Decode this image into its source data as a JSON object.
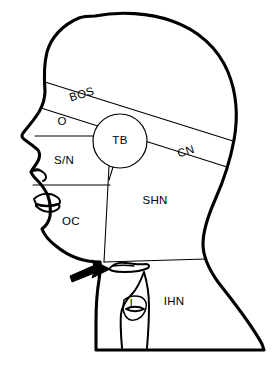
{
  "figure": {
    "view": "lateral profile, facing left",
    "background_color": "#ffffff",
    "line_color": "#000000"
  },
  "regions": [
    {
      "id": "bos",
      "abbr": "BOS",
      "name": "base-of-skull",
      "label_x": 82,
      "label_y": 95,
      "rotation": -17
    },
    {
      "id": "o",
      "abbr": "O",
      "name": "orbit",
      "label_x": 62,
      "label_y": 122,
      "rotation": 0
    },
    {
      "id": "tb",
      "abbr": "TB",
      "name": "temporal-bone",
      "label_x": 120,
      "label_y": 141,
      "rotation": 0
    },
    {
      "id": "cn",
      "abbr": "CN",
      "name": "cranial-nerves",
      "label_x": 186,
      "label_y": 152,
      "rotation": -17
    },
    {
      "id": "sn",
      "abbr": "S/N",
      "name": "sinus-nasal",
      "label_x": 64,
      "label_y": 161,
      "rotation": 0
    },
    {
      "id": "oc",
      "abbr": "OC",
      "name": "oral-cavity",
      "label_x": 71,
      "label_y": 222,
      "rotation": 0
    },
    {
      "id": "shn",
      "abbr": "SHN",
      "name": "suprahyoid-neck",
      "label_x": 155,
      "label_y": 201,
      "rotation": 0
    },
    {
      "id": "ihn",
      "abbr": "IHN",
      "name": "infrahyoid-neck",
      "label_x": 174,
      "label_y": 302,
      "rotation": 0
    },
    {
      "id": "l",
      "abbr": "L",
      "name": "larynx",
      "label_x": 133,
      "label_y": 304,
      "rotation": 0
    }
  ],
  "annotations": {
    "pointer": {
      "name": "hyoid-bone-arrow",
      "direction": "points right toward hyoid bone",
      "tip_x": 108,
      "tip_y": 270
    }
  }
}
